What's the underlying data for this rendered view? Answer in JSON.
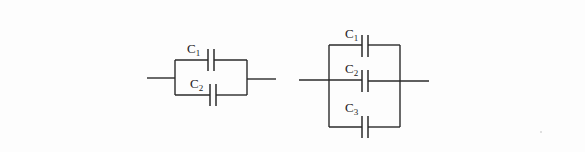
{
  "diagram": {
    "background": "#fdfdfd",
    "line_color": "#2a2a2a",
    "circuits": [
      {
        "id": "circuit-two-caps",
        "description": "Two capacitors in parallel",
        "capacitors": [
          {
            "label": "C",
            "sub": "1"
          },
          {
            "label": "C",
            "sub": "2"
          }
        ]
      },
      {
        "id": "circuit-three-caps",
        "description": "Three capacitors in parallel",
        "capacitors": [
          {
            "label": "C",
            "sub": "1"
          },
          {
            "label": "C",
            "sub": "2"
          },
          {
            "label": "C",
            "sub": "3"
          }
        ]
      }
    ]
  }
}
